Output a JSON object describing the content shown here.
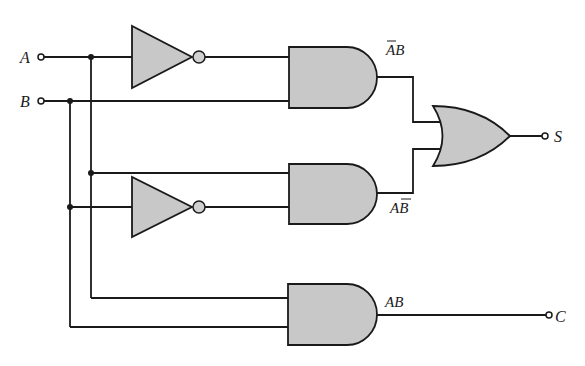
{
  "diagram": {
    "type": "half-adder logic circuit",
    "inputs": [
      {
        "label": "A"
      },
      {
        "label": "B"
      }
    ],
    "outputs": [
      {
        "label": "S"
      },
      {
        "label": "C"
      }
    ],
    "gates": [
      {
        "id": "not1",
        "type": "NOT",
        "input": "A"
      },
      {
        "id": "not2",
        "type": "NOT",
        "input": "B"
      },
      {
        "id": "and1",
        "type": "AND",
        "inputs": [
          "NOT A",
          "B"
        ],
        "output_label": {
          "base": "AB",
          "overbar_on": "A"
        }
      },
      {
        "id": "and2",
        "type": "AND",
        "inputs": [
          "A",
          "NOT B"
        ],
        "output_label": {
          "base": "AB",
          "overbar_on": "B"
        }
      },
      {
        "id": "or1",
        "type": "OR",
        "inputs": [
          "and1",
          "and2"
        ],
        "output": "S"
      },
      {
        "id": "and3",
        "type": "AND",
        "inputs": [
          "A",
          "B"
        ],
        "output_label": {
          "base": "AB"
        },
        "output": "C"
      }
    ],
    "labels": {
      "input_a": "A",
      "input_b": "B",
      "output_s": "S",
      "output_c": "C",
      "and1_a": "A",
      "and1_b": "B",
      "and2_a": "A",
      "and2_b": "B",
      "and3": "AB"
    },
    "colors": {
      "gate_fill": "#c8c8c8",
      "line": "#1a1a1a",
      "background": "#ffffff"
    }
  }
}
